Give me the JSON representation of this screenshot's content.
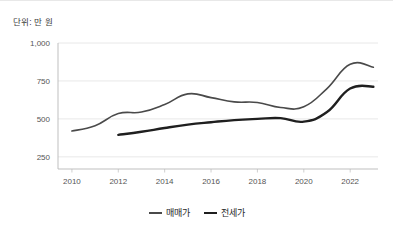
{
  "unit_note": "단위: 만 원",
  "colors": {
    "series_maemae": "#4a4a4a",
    "series_jeonse": "#1f1f1f",
    "gridline": "#e2e2e2",
    "axis": "#b8b8b8",
    "tick_text": "#555555",
    "background": "#ffffff"
  },
  "legend": {
    "position": "bottom-center",
    "items": [
      {
        "label": "매매가",
        "color": "#4a4a4a",
        "width": 1.6
      },
      {
        "label": "전세가",
        "color": "#1f1f1f",
        "width": 2.4
      }
    ]
  },
  "chart_data": {
    "type": "line",
    "title": "",
    "subtitle": "",
    "xlabel": "",
    "ylabel": "",
    "unit": "단위: 만 원",
    "grid": true,
    "legend_position": "bottom-center",
    "xlim": [
      2009.4,
      2023.2
    ],
    "ylim": [
      170,
      1000
    ],
    "ytick_values": [
      250,
      500,
      750,
      1000
    ],
    "ytick_labels": [
      "250",
      "500",
      "750",
      "1,000"
    ],
    "xtick_values": [
      2010,
      2012,
      2014,
      2016,
      2018,
      2020,
      2022
    ],
    "xtick_labels": [
      "2010",
      "2012",
      "2014",
      "2016",
      "2018",
      "2020",
      "2022"
    ],
    "x": [
      2010,
      2011,
      2012,
      2013,
      2014,
      2015,
      2016,
      2017,
      2018,
      2019,
      2020,
      2021,
      2022,
      2023
    ],
    "series": [
      {
        "name": "매매가",
        "color": "#4a4a4a",
        "values": [
          420,
          455,
          535,
          545,
          595,
          665,
          640,
          612,
          608,
          575,
          580,
          700,
          860,
          840
        ]
      },
      {
        "name": "전세가",
        "color": "#1f1f1f",
        "values": [
          null,
          null,
          395,
          415,
          440,
          462,
          478,
          492,
          500,
          505,
          482,
          545,
          700,
          712
        ]
      }
    ]
  }
}
